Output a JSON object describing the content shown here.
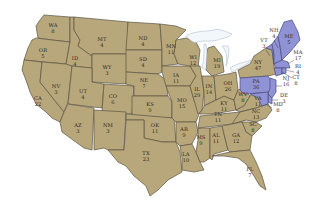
{
  "map": {
    "type": "US electoral votes by state",
    "colors": {
      "default_fill": "#b8a77a",
      "highlight_fill": "#8f93d6",
      "border": "#5b5446",
      "water": "#f3f6fa"
    },
    "highlighted_states": [
      "ME",
      "NH",
      "VT",
      "MA",
      "RI",
      "CT",
      "NJ",
      "DE",
      "MD",
      "PA"
    ],
    "states": [
      {
        "abbr": "WA",
        "ev": "8"
      },
      {
        "abbr": "OR",
        "ev": "5"
      },
      {
        "abbr": "CA",
        "ev": "22"
      },
      {
        "abbr": "ID",
        "ev": "4"
      },
      {
        "abbr": "NV",
        "ev": "3"
      },
      {
        "abbr": "MT",
        "ev": "4"
      },
      {
        "abbr": "WY",
        "ev": "3"
      },
      {
        "abbr": "UT",
        "ev": "4"
      },
      {
        "abbr": "AZ",
        "ev": "3"
      },
      {
        "abbr": "CO",
        "ev": "6"
      },
      {
        "abbr": "NM",
        "ev": "3"
      },
      {
        "abbr": "ND",
        "ev": "4"
      },
      {
        "abbr": "SD",
        "ev": "4"
      },
      {
        "abbr": "NE",
        "ev": "7"
      },
      {
        "abbr": "KS",
        "ev": "9"
      },
      {
        "abbr": "OK",
        "ev": "11"
      },
      {
        "abbr": "TX",
        "ev": "23"
      },
      {
        "abbr": "MN",
        "ev": "11"
      },
      {
        "abbr": "IA",
        "ev": "11"
      },
      {
        "abbr": "MO",
        "ev": "15"
      },
      {
        "abbr": "AR",
        "ev": "9"
      },
      {
        "abbr": "LA",
        "ev": "10"
      },
      {
        "abbr": "WI",
        "ev": "12"
      },
      {
        "abbr": "IL",
        "ev": "29"
      },
      {
        "abbr": "MS",
        "ev": "9"
      },
      {
        "abbr": "MI",
        "ev": "19"
      },
      {
        "abbr": "IN",
        "ev": "14"
      },
      {
        "abbr": "KY",
        "ev": "11"
      },
      {
        "abbr": "TN",
        "ev": "11"
      },
      {
        "abbr": "AL",
        "ev": "11"
      },
      {
        "abbr": "OH",
        "ev": "26"
      },
      {
        "abbr": "WV",
        "ev": "8"
      },
      {
        "abbr": "VA",
        "ev": "11"
      },
      {
        "abbr": "NC",
        "ev": "13"
      },
      {
        "abbr": "SC",
        "ev": "8"
      },
      {
        "abbr": "GA",
        "ev": "12"
      },
      {
        "abbr": "FL",
        "ev": "7"
      },
      {
        "abbr": "PA",
        "ev": "36"
      },
      {
        "abbr": "NY",
        "ev": "47"
      },
      {
        "abbr": "ME",
        "ev": "5"
      },
      {
        "abbr": "NH",
        "ev": "4"
      },
      {
        "abbr": "VT",
        "ev": "3"
      },
      {
        "abbr": "MA",
        "ev": "17"
      },
      {
        "abbr": "RI",
        "ev": "4"
      },
      {
        "abbr": "CT",
        "ev": "8"
      },
      {
        "abbr": "NJ",
        "ev": "16"
      },
      {
        "abbr": "DE",
        "ev": "3"
      },
      {
        "abbr": "MD",
        "ev": "8"
      }
    ]
  }
}
